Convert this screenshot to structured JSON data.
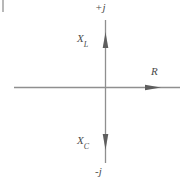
{
  "diagram": {
    "kind": "complex-impedance-phasor-plane",
    "labels": {
      "positive_imaginary": "+j",
      "negative_imaginary": "-j",
      "inductive_reactance": "X",
      "inductive_reactance_sub": "L",
      "capacitive_reactance": "X",
      "capacitive_reactance_sub": "C",
      "resistance": "R"
    },
    "colors": {
      "line": "#8a8a8a",
      "arrow": "#5a5a5a",
      "text": "#4a4a4a",
      "background": "#ffffff"
    },
    "geometry": {
      "origin_x": 105,
      "origin_y": 87,
      "vertical_top": 20,
      "vertical_bottom": 163,
      "horizontal_left": 14,
      "horizontal_right": 180
    }
  }
}
